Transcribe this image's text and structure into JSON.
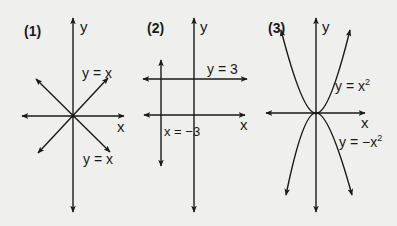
{
  "panels": [
    {
      "number": "(1)",
      "axis_x": "x",
      "axis_y": "y",
      "lines": [
        {
          "label": "y = x",
          "direction": "positive-slope"
        },
        {
          "label": "y = x",
          "direction": "negative-slope"
        }
      ]
    },
    {
      "number": "(2)",
      "axis_x": "x",
      "axis_y": "y",
      "lines": [
        {
          "label": "y = 3",
          "direction": "horizontal"
        },
        {
          "label": "x = −3",
          "direction": "vertical"
        }
      ]
    },
    {
      "number": "(3)",
      "axis_x": "x",
      "axis_y": "y",
      "curves": [
        {
          "label_base": "y = x",
          "exponent": "2",
          "direction": "opens-up"
        },
        {
          "label_base": "y = −x",
          "exponent": "2",
          "direction": "opens-down"
        }
      ]
    }
  ],
  "colors": {
    "background": "#efefee",
    "ink": "#1a1a1a"
  }
}
